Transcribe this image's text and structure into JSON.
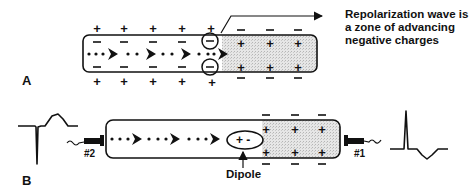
{
  "panel_a": {
    "label": "A",
    "caption_lines": [
      "Repolarization wave is",
      "a zone of advancing",
      "negative charges"
    ],
    "left_region": {
      "outer_top": "+",
      "inner_top": "−",
      "inner_bottom": "−",
      "outer_bottom": "+",
      "columns": 5
    },
    "right_region": {
      "outer_top": "−",
      "inner_top": "+",
      "inner_bottom": "+",
      "outer_bottom": "−",
      "columns": 3
    },
    "circled_charge": "−"
  },
  "panel_b": {
    "label": "B",
    "electrode_left": "#2",
    "electrode_right": "#1",
    "dipole_label": "Dipole",
    "dipole_charges": "+ -",
    "right_region": {
      "outer_top": "−",
      "inner_top": "+",
      "inner_bottom": "+",
      "outer_bottom": "−",
      "columns": 3
    },
    "ecg_left": "inverted-complex",
    "ecg_right": "upright-complex"
  },
  "colors": {
    "ink": "#111111",
    "shade": "#d9d9d9",
    "background": "#ffffff"
  }
}
